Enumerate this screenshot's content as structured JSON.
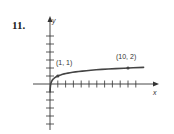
{
  "problem": {
    "number": "11."
  },
  "chart_data": {
    "type": "line",
    "title": "",
    "xlabel": "x",
    "ylabel": "y",
    "grid": false,
    "legend": null,
    "x_ticks": [
      1,
      2,
      3,
      4,
      5,
      6,
      7,
      8,
      9,
      10,
      11
    ],
    "y_ticks": [
      -5,
      -4,
      -3,
      -2,
      -1,
      1,
      2,
      3,
      4,
      5,
      6
    ],
    "xlim": [
      -2,
      12
    ],
    "ylim": [
      -5,
      8
    ],
    "series": [
      {
        "name": "curve",
        "x": [
          0.1,
          0.3,
          0.5,
          1,
          2,
          4,
          6,
          8,
          10,
          12
        ],
        "y": [
          0,
          0.48,
          0.7,
          1,
          1.3,
          1.6,
          1.78,
          1.9,
          2,
          2.08
        ]
      }
    ],
    "annotations": [
      {
        "label": "(1, 1)",
        "x": 1,
        "y": 1
      },
      {
        "label": "(10, 2)",
        "x": 10,
        "y": 2
      }
    ],
    "colors": {
      "axis": "#333333",
      "curve": "#444444"
    }
  }
}
